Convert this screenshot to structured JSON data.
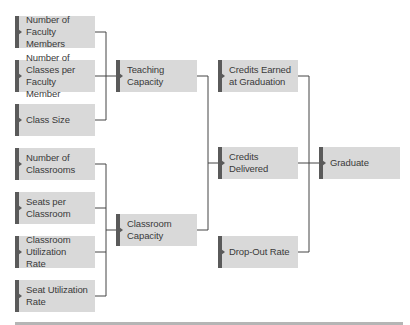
{
  "diagram": {
    "colors": {
      "box_fill": "#d9d9d9",
      "box_bar": "#5a5a5a",
      "connector": "#444444",
      "text": "#3a3a3a",
      "rule": "#b5b5b5"
    },
    "inputs": [
      {
        "id": "faculty",
        "label": "Number of Faculty Members"
      },
      {
        "id": "classes_per_faculty",
        "label": "Number of Classes per Faculty Member"
      },
      {
        "id": "class_size",
        "label": "Class Size"
      },
      {
        "id": "classrooms",
        "label": "Number of Classrooms"
      },
      {
        "id": "seats",
        "label": "Seats per Classroom"
      },
      {
        "id": "room_util",
        "label": "Classroom Utilization Rate"
      },
      {
        "id": "seat_util",
        "label": "Seat Utilization Rate"
      }
    ],
    "capacities": [
      {
        "id": "teaching",
        "label": "Teaching Capacity"
      },
      {
        "id": "classroom",
        "label": "Classroom Capacity"
      }
    ],
    "intermediate": [
      {
        "id": "credits_earned",
        "label": "Credits Earned at Graduation"
      },
      {
        "id": "credits_delivered",
        "label": "Credits Delivered"
      },
      {
        "id": "dropout",
        "label": "Drop-Out Rate"
      }
    ],
    "output": {
      "id": "graduate",
      "label": "Graduate"
    },
    "edges": [
      [
        "faculty",
        "teaching"
      ],
      [
        "classes_per_faculty",
        "teaching"
      ],
      [
        "class_size",
        "teaching"
      ],
      [
        "classrooms",
        "classroom"
      ],
      [
        "seats",
        "classroom"
      ],
      [
        "room_util",
        "classroom"
      ],
      [
        "seat_util",
        "classroom"
      ],
      [
        "teaching",
        "credits_delivered"
      ],
      [
        "classroom",
        "credits_delivered"
      ],
      [
        "credits_earned",
        "graduate"
      ],
      [
        "credits_delivered",
        "graduate"
      ],
      [
        "dropout",
        "graduate"
      ]
    ]
  }
}
